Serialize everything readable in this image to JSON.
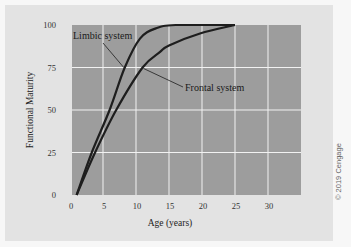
{
  "chart_data": {
    "type": "line",
    "title": "",
    "xlabel": "Age (years)",
    "ylabel": "Functional Maturity",
    "xlim": [
      0,
      35
    ],
    "ylim": [
      0,
      100
    ],
    "xticks": [
      0,
      5,
      10,
      15,
      20,
      25,
      30
    ],
    "yticks": [
      0,
      25,
      50,
      75,
      100
    ],
    "grid": true,
    "legend": "none (direct annotations)",
    "series": [
      {
        "name": "Limbic system",
        "x": [
          1,
          3.3,
          6,
          8.3,
          10.6,
          13,
          16,
          25
        ],
        "y": [
          0,
          25,
          50,
          75,
          92,
          98,
          100,
          100
        ]
      },
      {
        "name": "Frontal system",
        "x": [
          1,
          3.8,
          7,
          11,
          13.6,
          15,
          19.7,
          25
        ],
        "y": [
          0,
          25,
          50,
          75,
          84,
          88,
          95,
          100
        ]
      }
    ],
    "annotations": [
      {
        "text": "Limbic system",
        "target_series": "Limbic system",
        "point": [
          8.3,
          75
        ]
      },
      {
        "text": "Frontal system",
        "target_series": "Frontal system",
        "point": [
          11,
          75
        ]
      }
    ]
  },
  "credit": "© 2019 Cengage",
  "colors": {
    "panel": "#e3e3e3",
    "plot_bg": "#9d9d9d",
    "grid": "#f2f2f2",
    "line": "#1e1e1e"
  }
}
